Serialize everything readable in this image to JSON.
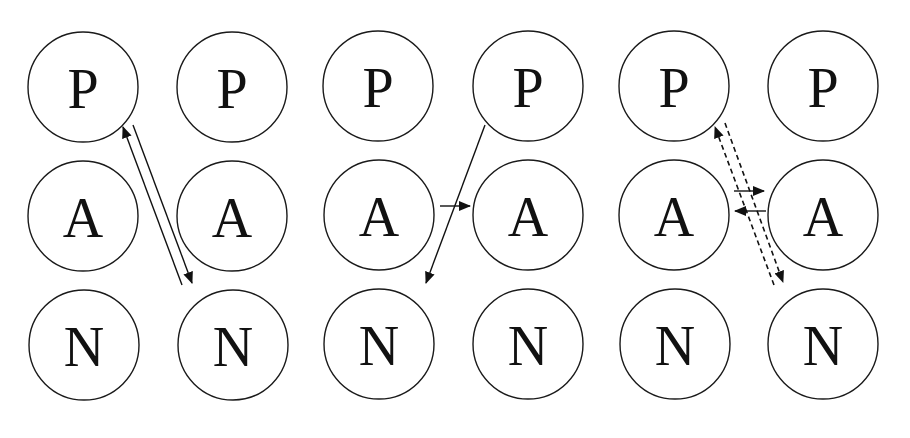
{
  "diagram": {
    "title": "",
    "colors": {
      "stroke": "#111111",
      "background": "#ffffff"
    },
    "panels": [
      {
        "id": "panel-1",
        "nodes": [
          {
            "label": "P",
            "col": 0,
            "row": 0
          },
          {
            "label": "P",
            "col": 1,
            "row": 0
          },
          {
            "label": "A",
            "col": 0,
            "row": 1
          },
          {
            "label": "A",
            "col": 1,
            "row": 1
          },
          {
            "label": "N",
            "col": 0,
            "row": 2
          },
          {
            "label": "N",
            "col": 1,
            "row": 2
          }
        ],
        "edges": [
          {
            "from": "N(right)",
            "to": "P(left)",
            "style": "solid",
            "arrow": "end"
          },
          {
            "from": "P(left)",
            "to": "N(right)",
            "style": "solid",
            "arrow": "end"
          }
        ]
      },
      {
        "id": "panel-2",
        "nodes": [
          {
            "label": "P",
            "col": 0,
            "row": 0
          },
          {
            "label": "P",
            "col": 1,
            "row": 0
          },
          {
            "label": "A",
            "col": 0,
            "row": 1
          },
          {
            "label": "A",
            "col": 1,
            "row": 1
          },
          {
            "label": "N",
            "col": 0,
            "row": 2
          },
          {
            "label": "N",
            "col": 1,
            "row": 2
          }
        ],
        "edges": [
          {
            "from": "P(right)",
            "to": "N(left)",
            "style": "solid",
            "arrow": "end"
          },
          {
            "from": "A(left)",
            "to": "A(right)",
            "style": "solid",
            "arrow": "end"
          }
        ]
      },
      {
        "id": "panel-3",
        "nodes": [
          {
            "label": "P",
            "col": 0,
            "row": 0
          },
          {
            "label": "P",
            "col": 1,
            "row": 0
          },
          {
            "label": "A",
            "col": 0,
            "row": 1
          },
          {
            "label": "A",
            "col": 1,
            "row": 1
          },
          {
            "label": "N",
            "col": 0,
            "row": 2
          },
          {
            "label": "N",
            "col": 1,
            "row": 2
          }
        ],
        "edges": [
          {
            "from": "N(right)",
            "to": "P(left)",
            "style": "dashed",
            "arrow": "end"
          },
          {
            "from": "P(left)",
            "to": "N(right)",
            "style": "dashed",
            "arrow": "end"
          },
          {
            "from": "A(left)",
            "to": "A(right)",
            "style": "solid",
            "arrow": "end"
          },
          {
            "from": "A(right)",
            "to": "A(left)",
            "style": "solid",
            "arrow": "end"
          }
        ]
      }
    ]
  }
}
